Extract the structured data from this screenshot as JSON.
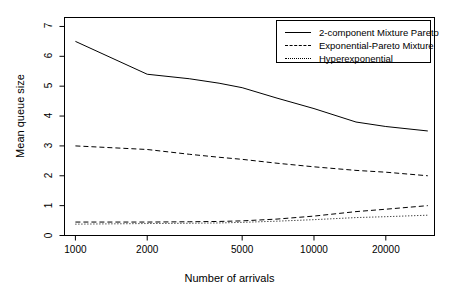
{
  "chart_data": {
    "type": "line",
    "title": "",
    "xlabel": "Number of arrivals",
    "ylabel": "Mean queue size",
    "xscale": "log",
    "xlim": [
      900,
      32000
    ],
    "ylim": [
      0,
      7.3
    ],
    "xticks": [
      1000,
      2000,
      5000,
      10000,
      20000
    ],
    "xtick_labels": [
      "1000",
      "2000",
      "5000",
      "10000",
      "20000"
    ],
    "yticks": [
      0,
      1,
      2,
      3,
      4,
      5,
      6,
      7
    ],
    "ytick_labels": [
      "0",
      "1",
      "2",
      "3",
      "4",
      "5",
      "6",
      "7"
    ],
    "grid": false,
    "legend_position": "top-right",
    "x": [
      1000,
      2000,
      3000,
      4000,
      5000,
      7000,
      10000,
      15000,
      20000,
      30000
    ],
    "series": [
      {
        "name": "2-component Mixture Pareto",
        "style": "solid",
        "color": "#000000",
        "values": [
          6.5,
          5.4,
          5.25,
          5.1,
          4.95,
          4.6,
          4.25,
          3.8,
          3.65,
          3.5
        ]
      },
      {
        "name": "Exponential-Pareto Mixture",
        "style": "dashed",
        "color": "#000000",
        "values": [
          3.0,
          2.88,
          2.72,
          2.62,
          2.55,
          2.42,
          2.3,
          2.18,
          2.12,
          2.0
        ]
      },
      {
        "name": "Hyperexponential",
        "style": "dotted",
        "color": "#000000",
        "values": [
          0.38,
          0.4,
          0.41,
          0.42,
          0.44,
          0.48,
          0.53,
          0.6,
          0.63,
          0.68
        ]
      },
      {
        "name": "Hyperexponential-upper",
        "style": "dashed",
        "color": "#000000",
        "values": [
          0.45,
          0.45,
          0.46,
          0.47,
          0.49,
          0.55,
          0.65,
          0.8,
          0.88,
          1.0
        ]
      }
    ],
    "legend": [
      {
        "label": "2-component Mixture Pareto",
        "style": "solid"
      },
      {
        "label": "Exponential-Pareto Mixture",
        "style": "dashed"
      },
      {
        "label": "Hyperexponential",
        "style": "dotted"
      }
    ]
  }
}
